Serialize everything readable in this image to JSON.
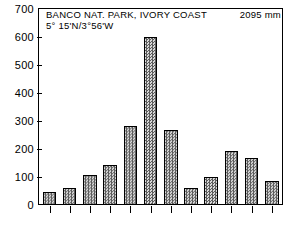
{
  "chart_data": {
    "type": "bar",
    "title": "BANCO NAT. PARK, IVORY COAST",
    "subtitle": "5° 15'N/3°56'W",
    "annotation": "2095 mm",
    "xlabel": "",
    "ylabel": "",
    "ylim": [
      0,
      700
    ],
    "yticks": [
      0,
      100,
      200,
      300,
      400,
      500,
      600,
      700
    ],
    "ytick_labels": [
      "0",
      "100",
      "200",
      "300",
      "400",
      "500",
      "600",
      "700"
    ],
    "grid": false,
    "legend": false,
    "categories": [
      "J",
      "F",
      "M",
      "A",
      "M",
      "J",
      "J",
      "A",
      "S",
      "O",
      "N",
      "D"
    ],
    "values": [
      45,
      58,
      105,
      140,
      280,
      600,
      265,
      60,
      100,
      190,
      165,
      85
    ],
    "bar_fill_color": "#9a9a9a",
    "bar_edge_color": "#000000",
    "axis_color": "#000000",
    "background_color": "#ffffff"
  },
  "axis": {
    "tick_label_0": "0",
    "tick_label_100": "100",
    "tick_label_200": "200",
    "tick_label_300": "300",
    "tick_label_400": "400",
    "tick_label_500": "500",
    "tick_label_600": "600",
    "tick_label_700": "700"
  },
  "header": {
    "title": "BANCO NAT. PARK, IVORY COAST",
    "coordinates": "5° 15'N/3°56'W",
    "annual_precipitation": "2095 mm"
  }
}
